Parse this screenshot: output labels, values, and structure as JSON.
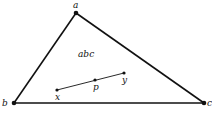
{
  "diagram": {
    "type": "geometry-triangle",
    "colors": {
      "stroke": "#111111",
      "background": "#ffffff"
    },
    "triangle": {
      "label": "abc",
      "vertices": [
        {
          "name": "a",
          "x": 76,
          "y": 13
        },
        {
          "name": "b",
          "x": 14,
          "y": 103
        },
        {
          "name": "c",
          "x": 204,
          "y": 103
        }
      ]
    },
    "segment": {
      "points": [
        {
          "name": "x",
          "x": 57,
          "y": 90
        },
        {
          "name": "p",
          "x": 95,
          "y": 80
        },
        {
          "name": "y",
          "x": 124,
          "y": 73
        }
      ]
    },
    "labels": {
      "a": "a",
      "b": "b",
      "c": "c",
      "x": "x",
      "p": "p",
      "y": "y",
      "region": "abc"
    }
  }
}
